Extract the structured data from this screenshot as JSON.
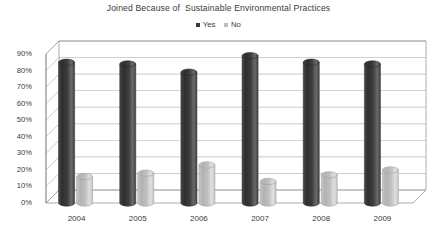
{
  "chart_data": {
    "type": "bar",
    "title": "Joined Because of  Sustainable Environmental Practices",
    "xlabel": "",
    "ylabel": "",
    "categories": [
      "2004",
      "2005",
      "2006",
      "2007",
      "2008",
      "2009"
    ],
    "series": [
      {
        "name": "Yes",
        "values": [
          85,
          84,
          79,
          89,
          85,
          84
        ],
        "color": "#3a3a3a"
      },
      {
        "name": "No",
        "values": [
          16,
          18,
          23,
          13,
          17,
          20
        ],
        "color": "#bdbdbd"
      }
    ],
    "ylim": [
      0,
      90
    ],
    "yticks": [
      "0%",
      "10%",
      "20%",
      "30%",
      "40%",
      "50%",
      "60%",
      "70%",
      "80%",
      "90%"
    ],
    "ytick_values": [
      0,
      10,
      20,
      30,
      40,
      50,
      60,
      70,
      80,
      90
    ],
    "grid": true,
    "legend_position": "top-center",
    "style": "3d-cylinder",
    "background": "#ffffff"
  },
  "legend": {
    "items": [
      {
        "label": "Yes",
        "marker": "square-dark"
      },
      {
        "label": "No",
        "marker": "square-light"
      }
    ]
  },
  "colors": {
    "series_yes": "#3a3a3a",
    "series_no": "#bdbdbd",
    "grid": "#9a9a9a",
    "axis": "#8a8a8a",
    "text": "#3a3a3a",
    "background": "#ffffff"
  }
}
